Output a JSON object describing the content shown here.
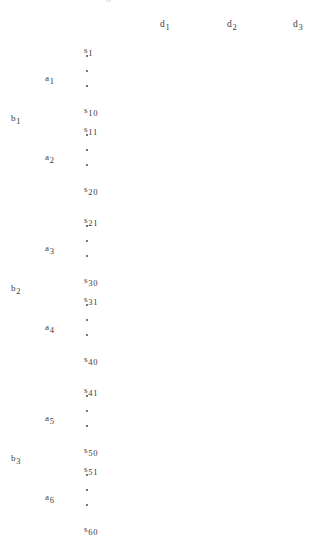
{
  "diagram": {
    "text_color": "#3a3a3a",
    "background_color": "#ffffff",
    "clipped_top_glyph": "g",
    "columns": [
      {
        "base": "d",
        "subscript": "1"
      },
      {
        "base": "d",
        "subscript": "2"
      },
      {
        "base": "d",
        "subscript": "3"
      }
    ],
    "b_groups": [
      {
        "base": "b",
        "subscript": "1",
        "a_groups": [
          {
            "base": "a",
            "subscript": "1",
            "first": {
              "base": "s",
              "subscript": "1"
            },
            "last": {
              "base": "s",
              "subscript": "10"
            },
            "ellipsis_dots": 3
          },
          {
            "base": "a",
            "subscript": "2",
            "first": {
              "base": "s",
              "subscript": "11"
            },
            "last": {
              "base": "s",
              "subscript": "20"
            },
            "ellipsis_dots": 3
          }
        ]
      },
      {
        "base": "b",
        "subscript": "2",
        "a_groups": [
          {
            "base": "a",
            "subscript": "3",
            "first": {
              "base": "s",
              "subscript": "21"
            },
            "last": {
              "base": "s",
              "subscript": "30"
            },
            "ellipsis_dots": 3
          },
          {
            "base": "a",
            "subscript": "4",
            "first": {
              "base": "s",
              "subscript": "31"
            },
            "last": {
              "base": "s",
              "subscript": "40"
            },
            "ellipsis_dots": 3
          }
        ]
      },
      {
        "base": "b",
        "subscript": "3",
        "a_groups": [
          {
            "base": "a",
            "subscript": "5",
            "first": {
              "base": "s",
              "subscript": "41"
            },
            "last": {
              "base": "s",
              "subscript": "50"
            },
            "ellipsis_dots": 3
          },
          {
            "base": "a",
            "subscript": "6",
            "first": {
              "base": "s",
              "subscript": "51"
            },
            "last": {
              "base": "s",
              "subscript": "60"
            },
            "ellipsis_dots": 3
          }
        ]
      }
    ],
    "layout": {
      "col_x": [
        160,
        227,
        293
      ],
      "col_y": 14,
      "s_x": 84,
      "a_x": 45,
      "b_x": 11,
      "group_first_y": [
        40,
        119,
        210,
        289,
        380,
        459
      ],
      "group_span": 60,
      "dot_x": 86
    }
  }
}
